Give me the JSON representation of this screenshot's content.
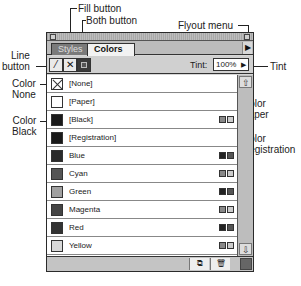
{
  "callouts": {
    "fill_button": "Fill button",
    "both_button": "Both button",
    "flyout_menu": "Flyout menu",
    "line_button": "Line\nbutton",
    "tint": "Tint",
    "color_none": "Color\nNone",
    "color_paper": "Color\nPaper",
    "color_black": "Color\nBlack",
    "color_registration": "Color\nRegistration"
  },
  "palette": {
    "tabs": [
      {
        "label": "Styles",
        "active": false
      },
      {
        "label": "Colors",
        "active": true
      }
    ],
    "flyout_icon": "▶",
    "tools": {
      "line_icon": "⁄",
      "fill_icon": "✕",
      "both_icon": "■"
    },
    "tint": {
      "label": "Tint:",
      "value": "100%",
      "arrow": "▶"
    },
    "colors": [
      {
        "name": "[None]",
        "swatch": "none",
        "modes": []
      },
      {
        "name": "[Paper]",
        "swatch": "#ffffff",
        "modes": []
      },
      {
        "name": "[Black]",
        "swatch": "#1a1a1a",
        "modes": [
          "process-cmyk",
          "process-icon"
        ]
      },
      {
        "name": "[Registration]",
        "swatch": "#1a1a1a",
        "modes": []
      },
      {
        "name": "Blue",
        "swatch": "#2a2a2a",
        "modes": [
          "spot",
          "spot-rgb"
        ]
      },
      {
        "name": "Cyan",
        "swatch": "#555555",
        "modes": [
          "process-cmyk",
          "process-icon"
        ]
      },
      {
        "name": "Green",
        "swatch": "#a0a0a0",
        "modes": [
          "spot",
          "spot-rgb"
        ]
      },
      {
        "name": "Magenta",
        "swatch": "#444444",
        "modes": [
          "process-cmyk",
          "process-icon"
        ]
      },
      {
        "name": "Red",
        "swatch": "#333333",
        "modes": [
          "spot",
          "spot-rgb"
        ]
      },
      {
        "name": "Yellow",
        "swatch": "#d8d8d8",
        "modes": [
          "process-cmyk",
          "process-icon"
        ]
      }
    ],
    "scroll": {
      "up_icon": "⇧",
      "down_icon": "⇩"
    },
    "bottom": {
      "new_icon": "⧉",
      "delete_icon": "🗑"
    }
  }
}
